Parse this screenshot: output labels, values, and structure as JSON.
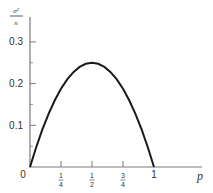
{
  "chart_data": {
    "type": "line",
    "title": "",
    "xlabel": "p",
    "ylabel": "σ²/n",
    "ylabel_parts": {
      "numerator": "σ²",
      "denominator": "n"
    },
    "xlim": [
      0,
      1.3
    ],
    "ylim": [
      0,
      0.35
    ],
    "grid": false,
    "legend": null,
    "x_ticks": [
      {
        "value": 0,
        "label": "0",
        "type": "plain"
      },
      {
        "value": 0.25,
        "label": "1/4",
        "num": "1",
        "den": "4",
        "type": "fraction"
      },
      {
        "value": 0.5,
        "label": "1/2",
        "num": "1",
        "den": "2",
        "type": "fraction"
      },
      {
        "value": 0.75,
        "label": "3/4",
        "num": "3",
        "den": "4",
        "type": "fraction"
      },
      {
        "value": 1,
        "label": "1",
        "type": "plain"
      }
    ],
    "y_ticks": [
      {
        "value": 0.1,
        "label": "0.1"
      },
      {
        "value": 0.2,
        "label": "0.2"
      },
      {
        "value": 0.3,
        "label": "0.3"
      }
    ],
    "y_minor_ticks": [
      0.05,
      0.15,
      0.25
    ],
    "series": [
      {
        "name": "p(1-p)",
        "x": [
          0,
          0.05,
          0.1,
          0.15,
          0.2,
          0.25,
          0.3,
          0.35,
          0.4,
          0.45,
          0.5,
          0.55,
          0.6,
          0.65,
          0.7,
          0.75,
          0.8,
          0.85,
          0.9,
          0.95,
          1
        ],
        "values": [
          0,
          0.0475,
          0.09,
          0.1275,
          0.16,
          0.1875,
          0.21,
          0.2275,
          0.24,
          0.2475,
          0.25,
          0.2475,
          0.24,
          0.2275,
          0.21,
          0.1875,
          0.16,
          0.1275,
          0.09,
          0.0475,
          0
        ]
      }
    ],
    "colors": {
      "axis": "#7a7a7a",
      "curve": "#1a1a1a",
      "text": "#333333"
    }
  }
}
